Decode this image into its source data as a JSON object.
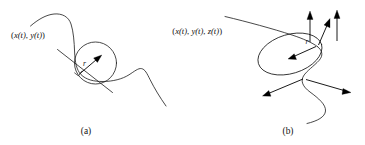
{
  "figure": {
    "background_color": "#ffffff",
    "ink_color": "#1a1a1a",
    "width": 365,
    "height": 145
  },
  "panels": [
    {
      "id": "a",
      "caption": "(a)",
      "curve_label": "(x(t), y(t))",
      "curve_label_parts": {
        "open": "(",
        "x": "x",
        "t1": "(t)",
        "sep1": ", ",
        "y": "y",
        "t2": "(t)",
        "close": ")"
      },
      "radius_label": "r",
      "description": "Plane curve with osculating circle, tangent line and radius vector",
      "elements": [
        "plane-curve",
        "osculating-circle",
        "tangent-line",
        "right-angle-mark",
        "radius-arrow"
      ]
    },
    {
      "id": "b",
      "caption": "(b)",
      "curve_label": "(x(t), y(t), z(t))",
      "curve_label_parts": {
        "open": "(",
        "x": "x",
        "t1": "(t)",
        "sep1": ", ",
        "y": "y",
        "t2": "(t)",
        "sep2": ", ",
        "z": "z",
        "t3": "(t)",
        "close": ")"
      },
      "radius_label": "r",
      "description": "Space curve with osculating disk, normal vectors and radius vector",
      "elements": [
        "space-curve",
        "osculating-disk",
        "normal-arrow-up-left",
        "normal-arrow-up-right",
        "normal-arrow-diagonal",
        "normal-arrow-down-left",
        "normal-arrow-down-right",
        "radius-arrow"
      ]
    }
  ]
}
